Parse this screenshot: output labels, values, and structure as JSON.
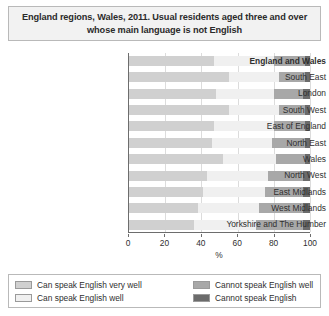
{
  "title": "England regions, Wales, 2011. Usual residents aged three and over whose main language is not English",
  "colors": {
    "series1": "#d0d0d0",
    "series2": "#f0f0f0",
    "series3": "#a8a8a8",
    "series4": "#6b6b6b",
    "axis": "#6d6d6d",
    "grid": "#dcdcdc",
    "title_bg": "#f2f2f2",
    "border": "#b9b9b9"
  },
  "chart_data": {
    "type": "bar",
    "orientation": "horizontal",
    "stacked": true,
    "stack_mode": "percent",
    "title": "England regions, Wales, 2011. Usual residents aged three and over whose main language is not English",
    "xlabel": "%",
    "ylabel": "",
    "xlim": [
      0,
      100
    ],
    "xticks": [
      0,
      20,
      40,
      60,
      80,
      100
    ],
    "grid": true,
    "legend_position": "bottom",
    "categories": [
      "England and Wales",
      "South East",
      "London",
      "South West",
      "East of England",
      "North East",
      "Wales",
      "North West",
      "East Midlands",
      "West Midlands",
      "Yorkshire and The Humber"
    ],
    "emphasized_categories": [
      "England and Wales"
    ],
    "series": [
      {
        "name": "Can speak English very well",
        "color": "#d0d0d0",
        "values": [
          47,
          55,
          48,
          55,
          47,
          46,
          52,
          43,
          41,
          38,
          36
        ]
      },
      {
        "name": "Can speak English well",
        "color": "#f0f0f0",
        "values": [
          33,
          28,
          32,
          28,
          33,
          33,
          29,
          34,
          34,
          34,
          34
        ]
      },
      {
        "name": "Cannot speak English well",
        "color": "#a8a8a8",
        "values": [
          17,
          14,
          16,
          14,
          17,
          18,
          16,
          19,
          21,
          24,
          26
        ]
      },
      {
        "name": "Cannot speak English",
        "color": "#6b6b6b",
        "values": [
          3,
          3,
          4,
          3,
          3,
          3,
          3,
          4,
          4,
          4,
          4
        ]
      }
    ]
  }
}
